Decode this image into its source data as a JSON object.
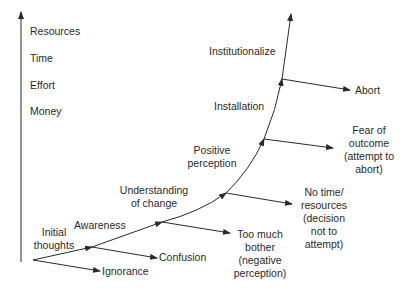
{
  "axis": {
    "labels": [
      "Resources",
      "Time",
      "Effort",
      "Money"
    ]
  },
  "stages": {
    "initial": [
      "Initial",
      "thoughts"
    ],
    "awareness": "Awareness",
    "understanding": [
      "Understanding",
      "of change"
    ],
    "positive": [
      "Positive",
      "perception"
    ],
    "installation": "Installation",
    "institutionalize": "Institutionalize"
  },
  "outcomes": {
    "ignorance": "Ignorance",
    "confusion": "Confusion",
    "too_much_bother": [
      "Too much",
      "bother",
      "(negative",
      "perception)"
    ],
    "no_time": [
      "No time/",
      "resources",
      "(decision",
      "not to",
      "attempt)"
    ],
    "fear": [
      "Fear of",
      "outcome",
      "(attempt to",
      "abort)"
    ],
    "abort": "Abort"
  },
  "colors": {
    "line": "#2a2a2a",
    "text": "#2a2a2a",
    "background": "#ffffff"
  }
}
